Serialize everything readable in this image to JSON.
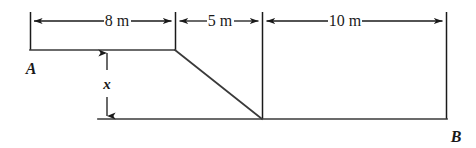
{
  "diagram": {
    "units": "m",
    "stroke_color": "#3a3a3a",
    "dimension_color": "#1a1a1a",
    "background_color": "#ffffff",
    "labels": {
      "point_a": "A",
      "point_b": "B",
      "vertical_dimension": "x"
    },
    "horizontal_dimensions": [
      {
        "name": "segment-8m",
        "label": "8 m",
        "value": 8,
        "x_start": 30,
        "x_end": 175
      },
      {
        "name": "segment-5m",
        "label": "5 m",
        "value": 5,
        "x_start": 175,
        "x_end": 262
      },
      {
        "name": "segment-10m",
        "label": "10 m",
        "value": 10,
        "x_start": 262,
        "x_end": 447
      }
    ],
    "vertical_dimension": {
      "name": "height-x",
      "label": "x",
      "x_position": 107,
      "y_top": 50,
      "y_bottom": 119
    },
    "geometry": {
      "upper_surface": {
        "y": 50,
        "x_start": 30,
        "x_end": 175
      },
      "slope": {
        "x_start": 175,
        "y_start": 50,
        "x_end": 262,
        "y_end": 119
      },
      "lower_surface": {
        "y": 119,
        "x_start": 98,
        "x_end": 447
      },
      "dimension_line_y": 21
    }
  }
}
